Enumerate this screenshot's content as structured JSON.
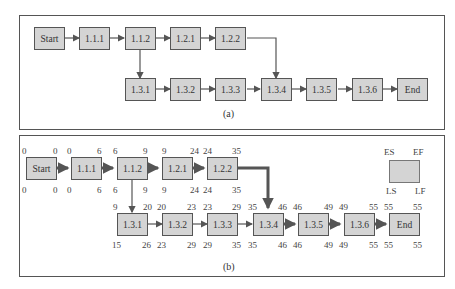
{
  "panel_a": {
    "caption": "(a)",
    "nodes": [
      "Start",
      "1.1.1",
      "1.1.2",
      "1.2.1",
      "1.2.2",
      "1.3.1",
      "1.3.2",
      "1.3.3",
      "1.3.4",
      "1.3.5",
      "1.3.6",
      "End"
    ]
  },
  "panel_b": {
    "caption": "(b)",
    "legend": {
      "es": "ES",
      "ef": "EF",
      "ls": "LS",
      "lf": "LF"
    },
    "nodes": [
      {
        "id": "Start",
        "es": "0",
        "ef": "0",
        "ls": "0",
        "lf": "0"
      },
      {
        "id": "1.1.1",
        "es": "0",
        "ef": "6",
        "ls": "0",
        "lf": "6"
      },
      {
        "id": "1.1.2",
        "es": "6",
        "ef": "9",
        "ls": "6",
        "lf": "9"
      },
      {
        "id": "1.2.1",
        "es": "9",
        "ef": "24",
        "ls": "9",
        "lf": "24"
      },
      {
        "id": "1.2.2",
        "es": "24",
        "ef": "35",
        "ls": "24",
        "lf": "35"
      },
      {
        "id": "1.3.1",
        "es": "9",
        "ef": "20",
        "ls": "15",
        "lf": "26"
      },
      {
        "id": "1.3.2",
        "es": "20",
        "ef": "23",
        "ls": "23",
        "lf": "29"
      },
      {
        "id": "1.3.3",
        "es": "23",
        "ef": "29",
        "ls": "29",
        "lf": "35"
      },
      {
        "id": "1.3.4",
        "es": "35",
        "ef": "46",
        "ls": "35",
        "lf": "46"
      },
      {
        "id": "1.3.5",
        "es": "46",
        "ef": "49",
        "ls": "46",
        "lf": "49"
      },
      {
        "id": "1.3.6",
        "es": "49",
        "ef": "55",
        "ls": "49",
        "lf": "55"
      },
      {
        "id": "End",
        "es": "55",
        "ef": "55",
        "ls": "55",
        "lf": "55"
      }
    ]
  }
}
